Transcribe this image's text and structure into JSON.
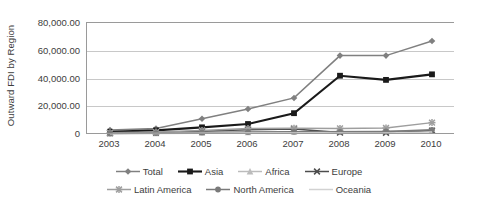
{
  "chart_data": {
    "type": "line",
    "title": "",
    "xlabel": "",
    "ylabel": "Outward FDI by Region",
    "categories": [
      "2003",
      "2004",
      "2005",
      "2006",
      "2007",
      "2008",
      "2009",
      "2010"
    ],
    "ylim": [
      0,
      80000
    ],
    "ytick_labels": [
      "80,000.00",
      "60,000.00",
      "40,000.00",
      "20,000.00",
      "0"
    ],
    "ytick_values": [
      80000,
      60000,
      40000,
      20000,
      0
    ],
    "grid": true,
    "legend_position": "bottom",
    "series": [
      {
        "name": "Total",
        "marker": "diamond",
        "color": "#808080",
        "values": [
          2800,
          4000,
          11000,
          18000,
          26000,
          56500,
          56500,
          67000
        ]
      },
      {
        "name": "Asia",
        "marker": "square",
        "color": "#1a1a1a",
        "values": [
          1600,
          2600,
          4800,
          7200,
          15000,
          42000,
          39000,
          43000
        ]
      },
      {
        "name": "Africa",
        "marker": "triangle",
        "color": "#bcbcbc",
        "values": [
          300,
          500,
          900,
          1200,
          1500,
          1800,
          2000,
          2600
        ]
      },
      {
        "name": "Europe",
        "marker": "cross",
        "color": "#4d4d4d",
        "values": [
          700,
          1100,
          1900,
          3000,
          3600,
          1000,
          900,
          2400
        ]
      },
      {
        "name": "Latin America",
        "marker": "asterisk",
        "color": "#9e9e9e",
        "values": [
          900,
          1400,
          2600,
          3900,
          4200,
          4000,
          4300,
          8200
        ]
      },
      {
        "name": "North America",
        "marker": "circle",
        "color": "#7a7a7a",
        "values": [
          400,
          700,
          1100,
          1500,
          1700,
          1600,
          1800,
          3000
        ]
      },
      {
        "name": "Oceania",
        "marker": "none",
        "color": "#d2d2d2",
        "values": [
          200,
          300,
          500,
          700,
          800,
          700,
          800,
          1500
        ]
      }
    ]
  }
}
